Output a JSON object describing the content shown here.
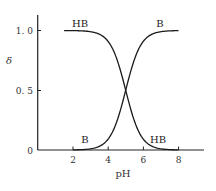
{
  "chart_data": {
    "type": "line",
    "title": "",
    "xlabel": "pH",
    "ylabel": "δ",
    "xlim": [
      0,
      9.5
    ],
    "ylim": [
      0,
      1.1
    ],
    "x_ticks": [
      2,
      4,
      6,
      8
    ],
    "x_tick_labels": [
      "2",
      "4",
      "6",
      "8"
    ],
    "y_ticks": [
      0,
      0.5,
      1.0
    ],
    "y_tick_labels": [
      "0",
      "0. 5",
      "1. 0"
    ],
    "grid": false,
    "legend": "none (curves labeled inline)",
    "pKa": 5.0,
    "series": [
      {
        "name": "HB",
        "x": [
          1.5,
          2,
          2.5,
          3,
          3.5,
          4,
          4.5,
          5,
          5.5,
          6,
          6.5,
          7,
          7.5,
          8
        ],
        "values": [
          1.0,
          1.0,
          1.0,
          0.99,
          0.97,
          0.91,
          0.76,
          0.5,
          0.24,
          0.09,
          0.03,
          0.01,
          0.0,
          0.0
        ]
      },
      {
        "name": "B",
        "x": [
          2,
          2.5,
          3,
          3.5,
          4,
          4.5,
          5,
          5.5,
          6,
          6.5,
          7,
          7.5,
          8
        ],
        "values": [
          0.0,
          0.0,
          0.01,
          0.03,
          0.09,
          0.24,
          0.5,
          0.76,
          0.91,
          0.97,
          0.99,
          1.0,
          1.0
        ]
      }
    ],
    "annotations": [
      {
        "text": "HB",
        "x": 2.8,
        "y": 1.05,
        "series": "HB"
      },
      {
        "text": "B",
        "x": 7.2,
        "y": 1.05,
        "series": "B"
      },
      {
        "text": "B",
        "x": 2.8,
        "y": 0.07,
        "series": "B"
      },
      {
        "text": "HB",
        "x": 7.0,
        "y": 0.07,
        "series": "HB"
      }
    ]
  },
  "labels": {
    "xlabel": "pH",
    "ylabel": "δ",
    "x_ticks": [
      "2",
      "4",
      "6",
      "8"
    ],
    "y_ticks": [
      "0",
      "0. 5",
      "1. 0"
    ],
    "hb_top": "HB",
    "b_top": "B",
    "b_bottom": "B",
    "hb_bottom": "HB"
  }
}
